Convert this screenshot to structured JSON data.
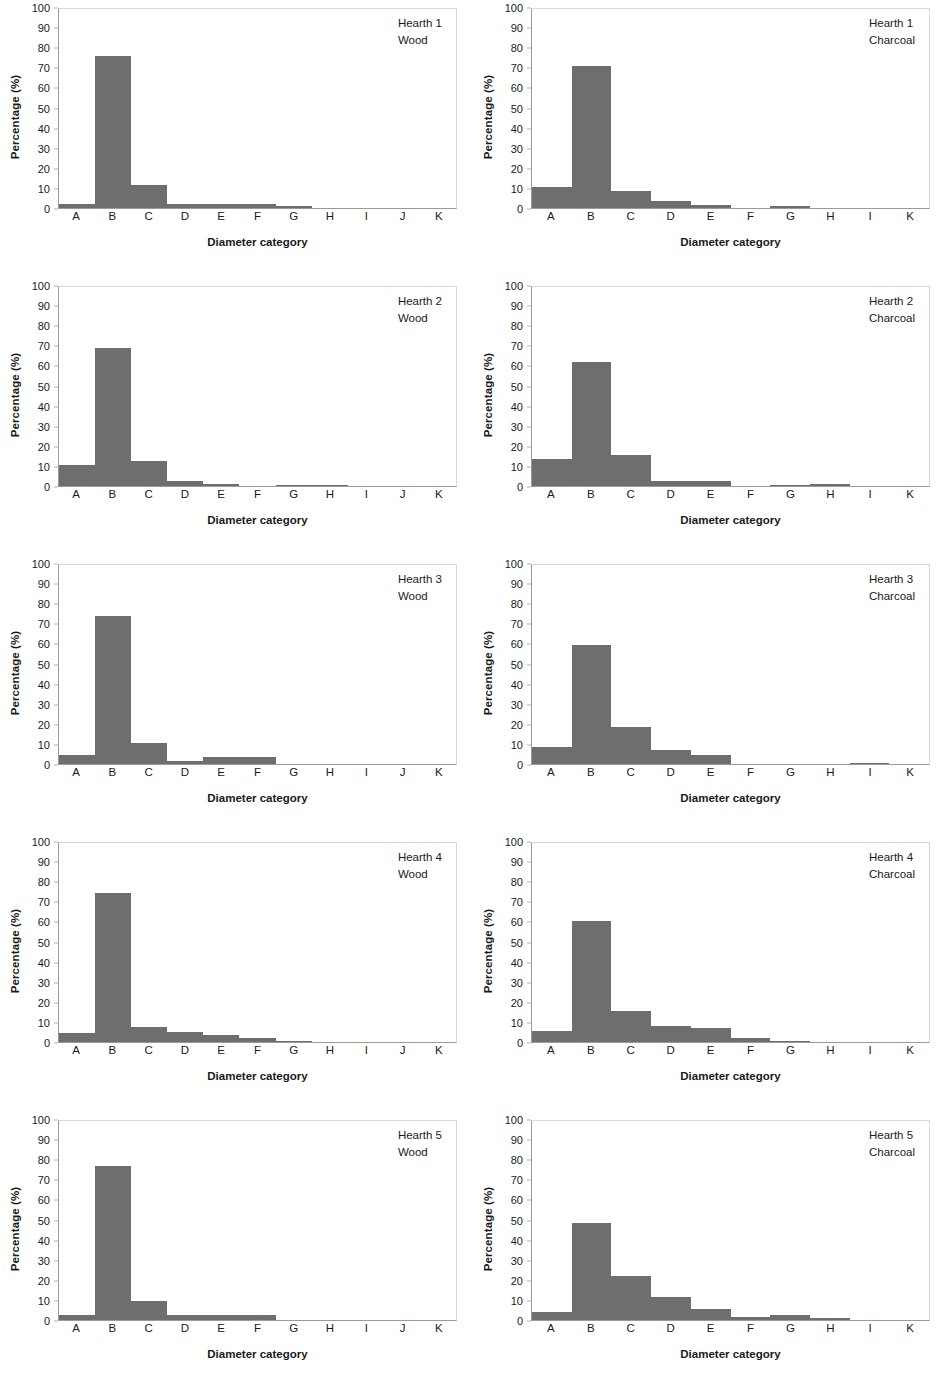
{
  "figure": {
    "axis": {
      "ylabel": "Percentage (%)",
      "xlabel": "Diameter category",
      "yticks": [
        100,
        90,
        80,
        70,
        60,
        50,
        40,
        30,
        20,
        10,
        0
      ],
      "ylim": [
        0,
        100
      ]
    },
    "colors": {
      "bar": "#6e6e6e",
      "frame": "#d8d8d8",
      "axis": "#9a9a9a",
      "text": "#1a1a1a"
    }
  },
  "chart_data": [
    {
      "type": "bar",
      "title": "Hearth 1",
      "subtitle": "Wood",
      "xlabel": "Diameter category",
      "ylabel": "Percentage (%)",
      "ylim": [
        0,
        100
      ],
      "grid": false,
      "legend": "none",
      "categories": [
        "A",
        "B",
        "C",
        "D",
        "E",
        "F",
        "G",
        "H",
        "I",
        "J",
        "K"
      ],
      "values": [
        1.8,
        75.5,
        11.5,
        1.8,
        1.8,
        1.8,
        0.8,
        0,
        0,
        0,
        0
      ]
    },
    {
      "type": "bar",
      "title": "Hearth 1",
      "subtitle": "Charcoal",
      "xlabel": "Diameter category",
      "ylabel": "Percentage (%)",
      "ylim": [
        0,
        100
      ],
      "grid": false,
      "legend": "none",
      "categories": [
        "A",
        "B",
        "C",
        "D",
        "E",
        "F",
        "G",
        "H",
        "I",
        "K"
      ],
      "values": [
        10.5,
        70.5,
        8.5,
        3.5,
        1.5,
        0,
        1.0,
        0,
        0,
        0
      ]
    },
    {
      "type": "bar",
      "title": "Hearth 2",
      "subtitle": "Wood",
      "xlabel": "Diameter category",
      "ylabel": "Percentage (%)",
      "ylim": [
        0,
        100
      ],
      "grid": false,
      "legend": "none",
      "categories": [
        "A",
        "B",
        "C",
        "D",
        "E",
        "F",
        "G",
        "H",
        "I",
        "J",
        "K"
      ],
      "values": [
        10.5,
        68.5,
        12.5,
        2.5,
        1.0,
        0,
        0.6,
        0.3,
        0,
        0,
        0
      ]
    },
    {
      "type": "bar",
      "title": "Hearth 2",
      "subtitle": "Charcoal",
      "xlabel": "Diameter category",
      "ylabel": "Percentage (%)",
      "ylim": [
        0,
        100
      ],
      "grid": false,
      "legend": "none",
      "categories": [
        "A",
        "B",
        "C",
        "D",
        "E",
        "F",
        "G",
        "H",
        "I",
        "K"
      ],
      "values": [
        13.5,
        61.5,
        15.5,
        2.5,
        2.5,
        0,
        0.3,
        1.0,
        0,
        0
      ]
    },
    {
      "type": "bar",
      "title": "Hearth 3",
      "subtitle": "Wood",
      "xlabel": "Diameter category",
      "ylabel": "Percentage (%)",
      "ylim": [
        0,
        100
      ],
      "grid": false,
      "legend": "none",
      "categories": [
        "A",
        "B",
        "C",
        "D",
        "E",
        "F",
        "G",
        "H",
        "I",
        "J",
        "K"
      ],
      "values": [
        4.5,
        73.5,
        10.5,
        1.3,
        3.3,
        3.3,
        0,
        0,
        0,
        0,
        0
      ]
    },
    {
      "type": "bar",
      "title": "Hearth 3",
      "subtitle": "Charcoal",
      "xlabel": "Diameter category",
      "ylabel": "Percentage (%)",
      "ylim": [
        0,
        100
      ],
      "grid": false,
      "legend": "none",
      "categories": [
        "A",
        "B",
        "C",
        "D",
        "E",
        "F",
        "G",
        "H",
        "I",
        "K"
      ],
      "values": [
        8.5,
        59.0,
        18.5,
        7.0,
        4.5,
        0,
        0,
        0,
        0.5,
        0
      ]
    },
    {
      "type": "bar",
      "title": "Hearth 4",
      "subtitle": "Wood",
      "xlabel": "Diameter category",
      "ylabel": "Percentage (%)",
      "ylim": [
        0,
        100
      ],
      "grid": false,
      "legend": "none",
      "categories": [
        "A",
        "B",
        "C",
        "D",
        "E",
        "F",
        "G",
        "H",
        "I",
        "J",
        "K"
      ],
      "values": [
        4.5,
        74.0,
        7.5,
        5.0,
        3.5,
        2.0,
        0.7,
        0,
        0,
        0,
        0
      ]
    },
    {
      "type": "bar",
      "title": "Hearth 4",
      "subtitle": "Charcoal",
      "xlabel": "Diameter category",
      "ylabel": "Percentage (%)",
      "ylim": [
        0,
        100
      ],
      "grid": false,
      "legend": "none",
      "categories": [
        "A",
        "B",
        "C",
        "D",
        "E",
        "F",
        "G",
        "H",
        "I",
        "K"
      ],
      "values": [
        5.5,
        60.0,
        15.5,
        8.0,
        7.0,
        2.0,
        0.5,
        0,
        0,
        0
      ]
    },
    {
      "type": "bar",
      "title": "Hearth 5",
      "subtitle": "Wood",
      "xlabel": "Diameter category",
      "ylabel": "Percentage (%)",
      "ylim": [
        0,
        100
      ],
      "grid": false,
      "legend": "none",
      "categories": [
        "A",
        "B",
        "C",
        "D",
        "E",
        "F",
        "G",
        "H",
        "I",
        "J",
        "K"
      ],
      "values": [
        2.5,
        76.5,
        9.5,
        2.5,
        2.5,
        2.5,
        0,
        0,
        0,
        0,
        0
      ]
    },
    {
      "type": "bar",
      "title": "Hearth 5",
      "subtitle": "Charcoal",
      "xlabel": "Diameter category",
      "ylabel": "Percentage (%)",
      "ylim": [
        0,
        100
      ],
      "grid": false,
      "legend": "none",
      "categories": [
        "A",
        "B",
        "C",
        "D",
        "E",
        "F",
        "G",
        "H",
        "I",
        "K"
      ],
      "values": [
        4.0,
        48.5,
        22.0,
        11.5,
        5.5,
        1.5,
        2.5,
        0.8,
        0,
        0
      ]
    }
  ]
}
